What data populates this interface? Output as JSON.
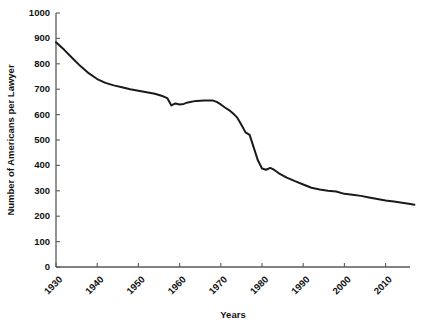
{
  "chart_data": {
    "type": "line",
    "title": "",
    "xlabel": "Years",
    "ylabel": "Number of Americans per Lawyer",
    "xlim": [
      1930,
      2018
    ],
    "ylim": [
      0,
      1000
    ],
    "grid": false,
    "legend": null,
    "legend_position": "none",
    "xticks": [
      1930,
      1940,
      1950,
      1960,
      1970,
      1980,
      1990,
      2000,
      2010
    ],
    "xtick_labels": [
      "1930",
      "1940",
      "1950",
      "1960",
      "1970",
      "1980",
      "1990",
      "2000",
      "2010"
    ],
    "yticks": [
      0,
      100,
      200,
      300,
      400,
      500,
      600,
      700,
      800,
      900,
      1000
    ],
    "ytick_labels": [
      "0",
      "100",
      "200",
      "300",
      "400",
      "500",
      "600",
      "700",
      "800",
      "900",
      "1000"
    ],
    "line_color": "#1a1a1a",
    "axis_color": "#5a5a5a",
    "series": [
      {
        "name": "Americans per Lawyer",
        "x": [
          1930,
          1932,
          1934,
          1936,
          1938,
          1940,
          1942,
          1944,
          1946,
          1948,
          1950,
          1952,
          1954,
          1956,
          1957,
          1958,
          1959,
          1960,
          1961,
          1962,
          1964,
          1966,
          1968,
          1969,
          1970,
          1971,
          1972,
          1973,
          1974,
          1975,
          1976,
          1977,
          1978,
          1979,
          1980,
          1981,
          1982,
          1983,
          1984,
          1986,
          1988,
          1990,
          1992,
          1994,
          1996,
          1998,
          2000,
          2002,
          2004,
          2006,
          2008,
          2010,
          2012,
          2014,
          2016,
          2017
        ],
        "y": [
          885,
          855,
          822,
          790,
          762,
          740,
          725,
          715,
          708,
          700,
          694,
          688,
          682,
          672,
          665,
          636,
          644,
          640,
          642,
          648,
          654,
          656,
          656,
          650,
          640,
          628,
          618,
          604,
          588,
          560,
          530,
          520,
          470,
          420,
          388,
          383,
          390,
          382,
          370,
          352,
          338,
          325,
          312,
          305,
          300,
          297,
          288,
          284,
          280,
          274,
          268,
          262,
          258,
          253,
          248,
          245
        ]
      }
    ]
  }
}
